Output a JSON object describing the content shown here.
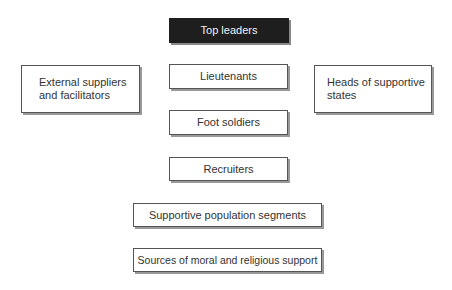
{
  "diagram": {
    "nodes": [
      {
        "id": "top-leaders",
        "label": "Top leaders",
        "style": "dark"
      },
      {
        "id": "external-suppliers",
        "label": "External suppliers and facilitators",
        "lines": [
          "External suppliers",
          "and facilitators"
        ]
      },
      {
        "id": "lieutenants",
        "label": "Lieutenants"
      },
      {
        "id": "heads-of-states",
        "label": "Heads of supportive states",
        "lines": [
          "Heads of supportive",
          "states"
        ]
      },
      {
        "id": "foot-soldiers",
        "label": "Foot soldiers"
      },
      {
        "id": "recruiters",
        "label": "Recruiters"
      },
      {
        "id": "supportive-population",
        "label": "Supportive population segments"
      },
      {
        "id": "moral-religious-support",
        "label": "Sources of moral and religious support"
      }
    ],
    "colors": {
      "dark_fill": "#1e1e1e",
      "border": "#555555",
      "shadow": "#999999"
    }
  }
}
